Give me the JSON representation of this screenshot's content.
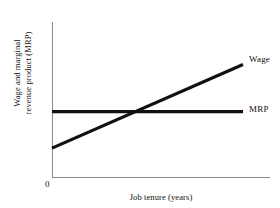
{
  "chart_data": {
    "type": "line",
    "title": "",
    "xlabel": "Job tenure (years)",
    "ylabel_line1": "Wage and marginal",
    "ylabel_line2": "revenue product (MRP)",
    "origin_label": "0",
    "xlim": [
      0,
      10
    ],
    "ylim": [
      0,
      10
    ],
    "grid": false,
    "legend_position": "right-of-line-ends",
    "line_color": "#111111",
    "axis_color": "#8a8a8a",
    "background": "#ffffff",
    "series": [
      {
        "name": "Wage",
        "label": "Wage",
        "x": [
          0,
          10
        ],
        "values": [
          1.9,
          7.4
        ],
        "style": "upward-sloping-line"
      },
      {
        "name": "MRP",
        "label": "MRP",
        "x": [
          0,
          10
        ],
        "values": [
          4.3,
          4.3
        ],
        "style": "horizontal-line"
      }
    ],
    "annotations": [
      {
        "name": "intersection",
        "description": "Wage line crosses MRP line",
        "x": 4.6,
        "y": 4.3
      }
    ]
  }
}
